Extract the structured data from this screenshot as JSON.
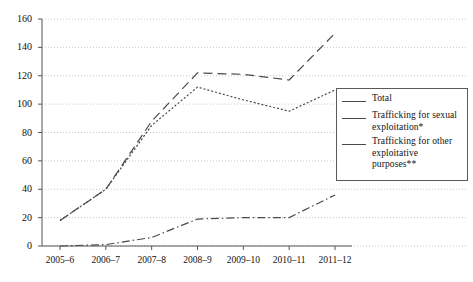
{
  "chart_data": {
    "type": "line",
    "title": "",
    "subtitle": "",
    "xlabel": "",
    "ylabel": "",
    "categories": [
      "2005–6",
      "2006–7",
      "2007–8",
      "2008–9",
      "2009–10",
      "2010–11",
      "2011–12"
    ],
    "ylim": [
      0,
      160
    ],
    "yticks": [
      0,
      20,
      40,
      60,
      80,
      100,
      120,
      140,
      160
    ],
    "grid": true,
    "legend_position": "right",
    "series": [
      {
        "name": "Total",
        "style": "dashed",
        "values": [
          18,
          40,
          88,
          122,
          121,
          117,
          150
        ]
      },
      {
        "name": "Trafficking for sexual exploitation*",
        "style": "dotted",
        "values": [
          18,
          40,
          85,
          112,
          103,
          95,
          110
        ]
      },
      {
        "name": "Trafficking for other exploitative purposes**",
        "style": "dash-dot",
        "values": [
          0,
          1,
          6,
          19,
          20,
          20,
          36
        ]
      }
    ]
  },
  "axes": {
    "y_tick_labels": [
      "160",
      "140",
      "120",
      "100",
      "80",
      "60",
      "40",
      "20",
      "0"
    ],
    "x_tick_labels": [
      "2005–6",
      "2006–7",
      "2007–8",
      "2008–9",
      "2009–10",
      "2010–11",
      "2011–12"
    ]
  },
  "legend": {
    "items": [
      {
        "label": "Total"
      },
      {
        "label": "Trafficking for sexual exploitation*"
      },
      {
        "label": "Trafficking for other exploitative purposes**"
      }
    ]
  },
  "colors": {
    "line": "#4a4a4a",
    "axis": "#555555",
    "grid": "#c9c9c9",
    "background": "#ffffff",
    "text": "#111111"
  }
}
